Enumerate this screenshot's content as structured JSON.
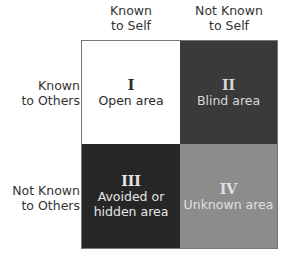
{
  "columns": [
    {
      "line1": "Known",
      "line2": "to Self"
    },
    {
      "line1": "Not Known",
      "line2": "to Self"
    }
  ],
  "rows": [
    {
      "line1": "Known",
      "line2": "to Others"
    },
    {
      "line1": "Not Known",
      "line2": "to Others"
    }
  ],
  "quadrants": [
    {
      "numeral": "I",
      "label_line1": "Open area",
      "label_line2": "",
      "fill": "#ffffff",
      "text_color": "#2a2a2a"
    },
    {
      "numeral": "II",
      "label_line1": "Blind area",
      "label_line2": "",
      "fill": "#3a3a3a",
      "text_color": "#d8d8d8"
    },
    {
      "numeral": "III",
      "label_line1": "Avoided or",
      "label_line2": "hidden area",
      "fill": "#262626",
      "text_color": "#e6e6e6"
    },
    {
      "numeral": "IV",
      "label_line1": "Unknown area",
      "label_line2": "",
      "fill": "#8c8c8c",
      "text_color": "#e0e0e0"
    }
  ]
}
